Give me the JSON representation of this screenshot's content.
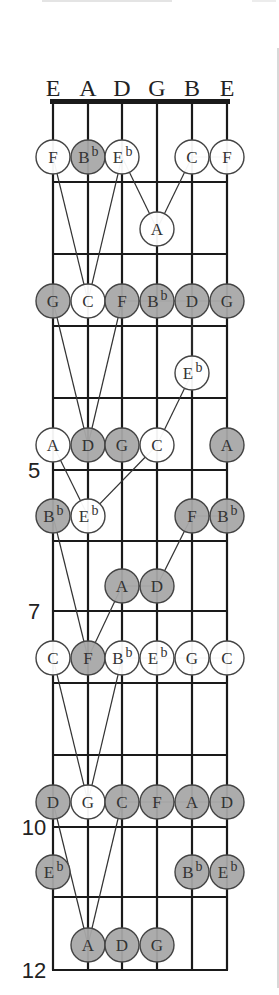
{
  "diagram": {
    "string_names": [
      "E",
      "A",
      "D",
      "G",
      "B",
      "E"
    ],
    "fret_labels": [
      {
        "fret": 5,
        "label": "5"
      },
      {
        "fret": 7,
        "label": "7"
      },
      {
        "fret": 10,
        "label": "10"
      },
      {
        "fret": 12,
        "label": "12"
      }
    ],
    "frets_shown": 12,
    "colors": {
      "filled_note": "#a8a8a8",
      "open_note": "#ffffff",
      "lines": "#1a1a1a"
    },
    "notes": [
      {
        "fret": 1,
        "string": 0,
        "name": "F",
        "filled": false
      },
      {
        "fret": 1,
        "string": 1,
        "name": "B",
        "accidental": "b",
        "filled": true
      },
      {
        "fret": 1,
        "string": 2,
        "name": "E",
        "accidental": "b",
        "filled": false
      },
      {
        "fret": 1,
        "string": 4,
        "name": "C",
        "filled": false
      },
      {
        "fret": 1,
        "string": 5,
        "name": "F",
        "filled": false
      },
      {
        "fret": 2,
        "string": 3,
        "name": "A",
        "filled": false
      },
      {
        "fret": 3,
        "string": 0,
        "name": "G",
        "filled": true
      },
      {
        "fret": 3,
        "string": 1,
        "name": "C",
        "filled": false
      },
      {
        "fret": 3,
        "string": 2,
        "name": "F",
        "filled": true
      },
      {
        "fret": 3,
        "string": 3,
        "name": "B",
        "accidental": "b",
        "filled": true
      },
      {
        "fret": 3,
        "string": 4,
        "name": "D",
        "filled": true
      },
      {
        "fret": 3,
        "string": 5,
        "name": "G",
        "filled": true
      },
      {
        "fret": 4,
        "string": 4,
        "name": "E",
        "accidental": "b",
        "filled": false
      },
      {
        "fret": 5,
        "string": 0,
        "name": "A",
        "filled": false
      },
      {
        "fret": 5,
        "string": 1,
        "name": "D",
        "filled": true
      },
      {
        "fret": 5,
        "string": 2,
        "name": "G",
        "filled": true
      },
      {
        "fret": 5,
        "string": 3,
        "name": "C",
        "filled": false
      },
      {
        "fret": 5,
        "string": 5,
        "name": "A",
        "filled": true
      },
      {
        "fret": 6,
        "string": 0,
        "name": "B",
        "accidental": "b",
        "filled": true
      },
      {
        "fret": 6,
        "string": 1,
        "name": "E",
        "accidental": "b",
        "filled": false
      },
      {
        "fret": 6,
        "string": 4,
        "name": "F",
        "filled": true
      },
      {
        "fret": 6,
        "string": 5,
        "name": "B",
        "accidental": "b",
        "filled": true
      },
      {
        "fret": 7,
        "string": 2,
        "name": "A",
        "filled": true
      },
      {
        "fret": 7,
        "string": 3,
        "name": "D",
        "filled": true
      },
      {
        "fret": 8,
        "string": 0,
        "name": "C",
        "filled": false
      },
      {
        "fret": 8,
        "string": 1,
        "name": "F",
        "filled": true
      },
      {
        "fret": 8,
        "string": 2,
        "name": "B",
        "accidental": "b",
        "filled": false
      },
      {
        "fret": 8,
        "string": 3,
        "name": "E",
        "accidental": "b",
        "filled": false
      },
      {
        "fret": 8,
        "string": 4,
        "name": "G",
        "filled": false
      },
      {
        "fret": 8,
        "string": 5,
        "name": "C",
        "filled": false
      },
      {
        "fret": 10,
        "string": 0,
        "name": "D",
        "filled": true
      },
      {
        "fret": 10,
        "string": 1,
        "name": "G",
        "filled": false
      },
      {
        "fret": 10,
        "string": 2,
        "name": "C",
        "filled": true
      },
      {
        "fret": 10,
        "string": 3,
        "name": "F",
        "filled": true
      },
      {
        "fret": 10,
        "string": 4,
        "name": "A",
        "filled": true
      },
      {
        "fret": 10,
        "string": 5,
        "name": "D",
        "filled": true
      },
      {
        "fret": 11,
        "string": 0,
        "name": "E",
        "accidental": "b",
        "filled": true
      },
      {
        "fret": 11,
        "string": 4,
        "name": "B",
        "accidental": "b",
        "filled": true
      },
      {
        "fret": 11,
        "string": 5,
        "name": "E",
        "accidental": "b",
        "filled": true
      },
      {
        "fret": 12,
        "string": 1,
        "name": "A",
        "filled": true
      },
      {
        "fret": 12,
        "string": 2,
        "name": "D",
        "filled": true
      },
      {
        "fret": 12,
        "string": 3,
        "name": "G",
        "filled": true
      }
    ],
    "connections": [
      [
        [
          1,
          0
        ],
        [
          3,
          1
        ]
      ],
      [
        [
          1,
          2
        ],
        [
          3,
          1
        ]
      ],
      [
        [
          1,
          2
        ],
        [
          2,
          3
        ]
      ],
      [
        [
          2,
          3
        ],
        [
          1,
          4
        ]
      ],
      [
        [
          1,
          4
        ],
        [
          1,
          5
        ]
      ],
      [
        [
          3,
          0
        ],
        [
          5,
          1
        ]
      ],
      [
        [
          3,
          2
        ],
        [
          5,
          1
        ]
      ],
      [
        [
          3,
          2
        ],
        [
          3,
          5
        ]
      ],
      [
        [
          3,
          4
        ],
        [
          4,
          4
        ]
      ],
      [
        [
          4,
          4
        ],
        [
          5,
          3
        ]
      ],
      [
        [
          5,
          0
        ],
        [
          6,
          1
        ]
      ],
      [
        [
          5,
          3
        ],
        [
          6,
          1
        ]
      ],
      [
        [
          6,
          4
        ],
        [
          6,
          5
        ]
      ],
      [
        [
          6,
          0
        ],
        [
          8,
          1
        ]
      ],
      [
        [
          7,
          2
        ],
        [
          8,
          1
        ]
      ],
      [
        [
          7,
          2
        ],
        [
          7,
          3
        ]
      ],
      [
        [
          7,
          3
        ],
        [
          6,
          4
        ]
      ],
      [
        [
          8,
          0
        ],
        [
          10,
          1
        ]
      ],
      [
        [
          8,
          2
        ],
        [
          10,
          1
        ]
      ],
      [
        [
          8,
          2
        ],
        [
          8,
          5
        ]
      ],
      [
        [
          10,
          0
        ],
        [
          12,
          1
        ]
      ],
      [
        [
          10,
          2
        ],
        [
          12,
          1
        ]
      ],
      [
        [
          10,
          2
        ],
        [
          10,
          5
        ]
      ]
    ]
  }
}
